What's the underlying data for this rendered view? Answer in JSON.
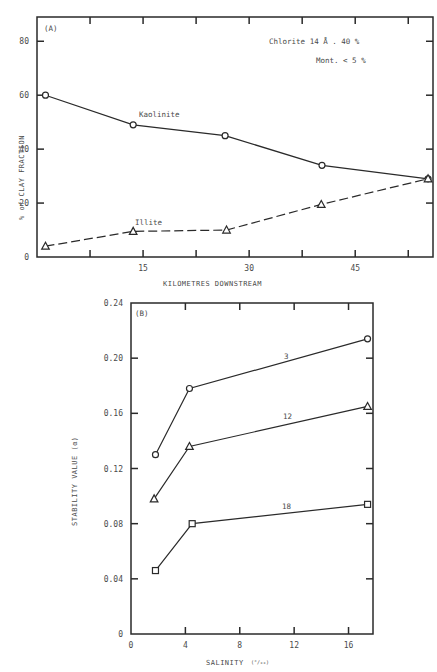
{
  "chart_data": [
    {
      "type": "line",
      "panel_label": "(A)",
      "title": "",
      "xlabel": "KILOMETRES  DOWNSTREAM",
      "ylabel": "% of CLAY FRACTION",
      "xlim": [
        0,
        56
      ],
      "ylim": [
        0,
        89
      ],
      "x_ticks": [
        15,
        30,
        45
      ],
      "x_minor_ticks": [
        7.5,
        22.5,
        37.5,
        52.5
      ],
      "y_ticks": [
        0,
        20,
        40,
        60,
        80
      ],
      "grid": false,
      "annotations": [
        "Chlorite  14 Å . 40 %",
        "Mont. < 5 %"
      ],
      "series": [
        {
          "name": "Kaolinite",
          "marker": "circle",
          "line_style": "solid",
          "x": [
            1.2,
            13.6,
            26.6,
            40.3,
            55.3
          ],
          "y": [
            60,
            49,
            45,
            34,
            29
          ]
        },
        {
          "name": "Illite",
          "marker": "triangle",
          "line_style": "dashed",
          "x": [
            1.2,
            13.6,
            26.8,
            40.2,
            55.3
          ],
          "y": [
            4,
            9.5,
            10,
            19.5,
            29
          ]
        }
      ]
    },
    {
      "type": "line",
      "panel_label": "(B)",
      "title": "",
      "xlabel": "SALINITY",
      "xlabel_unit": "(°/₀₀)",
      "ylabel": "STABILITY VALUE (α)",
      "xlim": [
        0,
        17.8
      ],
      "ylim": [
        0,
        0.24
      ],
      "x_ticks": [
        0,
        4,
        8,
        12,
        16
      ],
      "y_ticks": [
        0,
        0.04,
        0.08,
        0.12,
        0.16,
        0.2,
        0.24
      ],
      "y_tick_labels": [
        "0",
        "0.04",
        "0.08",
        "0.12",
        "0.16",
        "0.20",
        "0.24"
      ],
      "grid": false,
      "series": [
        {
          "name": "3",
          "marker": "circle",
          "line_style": "solid",
          "x": [
            1.8,
            4.3,
            17.4
          ],
          "y": [
            0.13,
            0.178,
            0.214
          ]
        },
        {
          "name": "12",
          "marker": "triangle",
          "line_style": "solid",
          "x": [
            1.7,
            4.3,
            17.4
          ],
          "y": [
            0.098,
            0.136,
            0.165
          ]
        },
        {
          "name": "18",
          "marker": "square",
          "line_style": "solid",
          "x": [
            1.8,
            4.5,
            17.4
          ],
          "y": [
            0.046,
            0.08,
            0.094
          ]
        }
      ]
    }
  ],
  "text": {
    "a_panel": "(A)",
    "a_xlabel": "KILOMETRES  DOWNSTREAM",
    "a_ylabel": "% of CLAY FRACTION",
    "a_anno1": "Chlorite  14 Å . 40 %",
    "a_anno2": "Mont. < 5 %",
    "a_series1": "Kaolinite",
    "a_series2": "Illite",
    "b_panel": "(B)",
    "b_xlabel": "SALINITY",
    "b_xunit": "(°/₀₀)",
    "b_ylabel": "STABILITY VALUE (α)",
    "b_series1": "3",
    "b_series2": "12",
    "b_series3": "18"
  }
}
